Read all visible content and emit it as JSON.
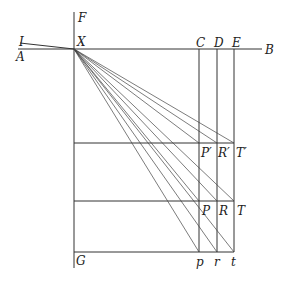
{
  "diagram": {
    "labels": {
      "F": "F",
      "I": "I",
      "A": "A",
      "X": "X",
      "B": "B",
      "C": "C",
      "D": "D",
      "E": "E",
      "P1": "P′",
      "R1": "R′",
      "T1": "T′",
      "P": "P",
      "R": "R",
      "T": "T",
      "G": "G",
      "p": "p",
      "r": "r",
      "t": "t"
    },
    "points": {
      "X": [
        74,
        49
      ],
      "P1": [
        199,
        143
      ],
      "R1": [
        217,
        143
      ],
      "T1": [
        234,
        143
      ],
      "P": [
        199,
        201
      ],
      "R": [
        217,
        201
      ],
      "T": [
        234,
        201
      ],
      "p": [
        199,
        252
      ],
      "r": [
        217,
        252
      ],
      "t": [
        234,
        252
      ]
    },
    "stroke_color": "#333333"
  }
}
